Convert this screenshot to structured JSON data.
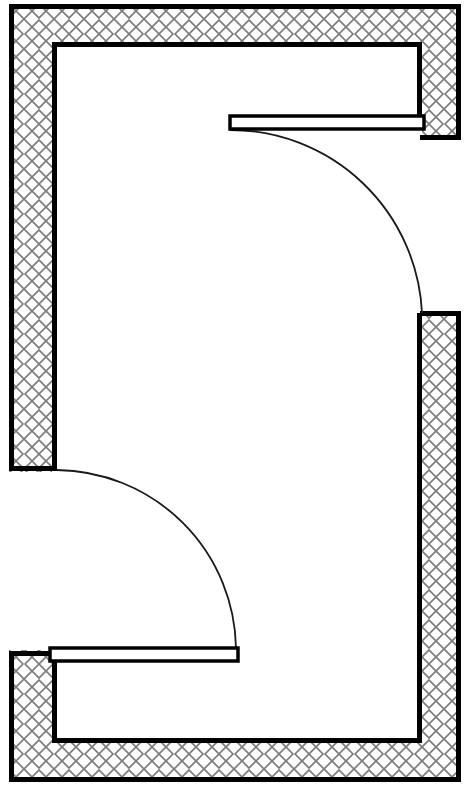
{
  "document": {
    "type": "architectural-floor-plan",
    "title": "Room Plan with Two Doors",
    "canvas_width": 469,
    "canvas_height": 798,
    "background_color": "#ffffff",
    "line_color": "#000000",
    "hatch_color": "#7d7d7d",
    "wall_fill_color": "#fdfdfd",
    "room_fill_color": "#ffffff"
  },
  "geometry": {
    "outer_boundary": {
      "name": "outer-wall-outline",
      "x": 9,
      "y": 4,
      "width": 452,
      "height": 778,
      "stroke_width": 5
    },
    "inner_boundary": {
      "name": "room-interior-outline",
      "x": 52,
      "y": 42,
      "width": 370,
      "height": 701,
      "stroke_width": 5
    },
    "wall_thickness": 40,
    "hatch_spacing": 30,
    "hatch_stroke_width": 1.6,
    "openings": [
      {
        "name": "right-wall-doorway",
        "side": "right",
        "x": 422,
        "y": 135,
        "width": 39,
        "height": 178
      },
      {
        "name": "left-wall-doorway",
        "side": "left",
        "x": 9,
        "y": 472,
        "width": 43,
        "height": 178
      }
    ],
    "doors": [
      {
        "name": "upper-door",
        "leaf": {
          "x": 230,
          "y": 116,
          "width": 194,
          "height": 13,
          "stroke_width": 3.5
        },
        "swing_arc": {
          "hinge_x": 422,
          "hinge_y": 130,
          "radius": 192,
          "start_x": 230,
          "start_y": 130,
          "end_x": 422,
          "end_y": 313,
          "sweep": 1,
          "stroke_width": 1.8
        }
      },
      {
        "name": "lower-door",
        "leaf": {
          "x": 50,
          "y": 648,
          "width": 188,
          "height": 13,
          "stroke_width": 3.5
        },
        "swing_arc": {
          "hinge_x": 55,
          "hinge_y": 470,
          "radius": 181,
          "start_x": 57,
          "start_y": 470,
          "end_x": 236,
          "end_y": 648,
          "sweep": 1,
          "stroke_width": 1.8
        }
      }
    ]
  },
  "labels": {
    "plan_name": "Room Plan with Two Doors",
    "legend_hatch": "hatched-masonry-wall",
    "legend_door": "single-swing-door"
  }
}
